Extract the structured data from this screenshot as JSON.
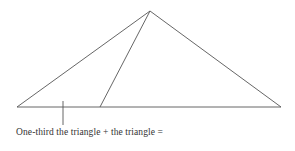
{
  "diagram": {
    "caption": "One-third the triangle + the triangle =",
    "line_color": "#555555",
    "shapes": {
      "triangle": {
        "apex": [
          150,
          11
        ],
        "left": [
          17,
          107
        ],
        "right": [
          281,
          107
        ]
      },
      "inner_line": {
        "from": [
          150,
          11
        ],
        "to": [
          100,
          107
        ]
      },
      "tick": {
        "from": [
          63,
          101
        ],
        "to": [
          63,
          125
        ]
      }
    }
  }
}
